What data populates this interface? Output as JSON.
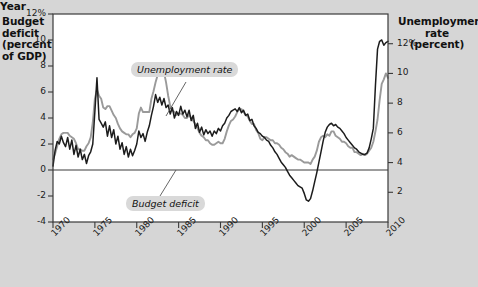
{
  "axes": {
    "left_title": "Budget deficit (percent of GDP)",
    "left_title_lines": [
      "Budget",
      "deficit",
      "(percent",
      "of GDP)"
    ],
    "right_title_lines": [
      "Unemployment",
      "rate",
      "(percent)"
    ],
    "x_title": "Year",
    "left_ticks": [
      "12%",
      "10",
      "8",
      "6",
      "4",
      "2",
      "0",
      "-2",
      "-4"
    ],
    "right_ticks": [
      "12%",
      "10",
      "8",
      "6",
      "4",
      "2"
    ],
    "x_ticks": [
      "1970",
      "1975",
      "1980",
      "1985",
      "1990",
      "1995",
      "2000",
      "2005",
      "2010"
    ]
  },
  "annotations": {
    "unemployment_label": "Unemployment rate",
    "deficit_label": "Budget deficit"
  },
  "colors": {
    "background": "#d6d6d6",
    "plot_background": "#ffffff",
    "unemployment_line": "#9a9a9a",
    "deficit_line": "#1c1c1c",
    "axis": "#3a3a3a",
    "callout_background": "#d9d9d9"
  },
  "chart_data": {
    "type": "line",
    "title": "",
    "xlabel": "Year",
    "ylabel": "Budget deficit (percent of GDP)",
    "ylabel_right": "Unemployment rate (percent)",
    "xlim": [
      1970,
      2010
    ],
    "ylim": [
      -4,
      12
    ],
    "ylim_right": [
      0,
      14
    ],
    "grid": false,
    "legend": "inline-callouts",
    "series": [
      {
        "name": "Budget deficit",
        "axis": "left",
        "color": "#1c1c1c",
        "x": [
          1970.0,
          1970.25,
          1970.5,
          1970.75,
          1971.0,
          1971.25,
          1971.5,
          1971.75,
          1972.0,
          1972.25,
          1972.5,
          1972.75,
          1973.0,
          1973.25,
          1973.5,
          1973.75,
          1974.0,
          1974.25,
          1974.5,
          1974.75,
          1975.0,
          1975.25,
          1975.5,
          1975.75,
          1976.0,
          1976.25,
          1976.5,
          1976.75,
          1977.0,
          1977.25,
          1977.5,
          1977.75,
          1978.0,
          1978.25,
          1978.5,
          1978.75,
          1979.0,
          1979.25,
          1979.5,
          1979.75,
          1980.0,
          1980.25,
          1980.5,
          1980.75,
          1981.0,
          1981.25,
          1981.5,
          1981.75,
          1982.0,
          1982.25,
          1982.5,
          1982.75,
          1983.0,
          1983.25,
          1983.5,
          1983.75,
          1984.0,
          1984.25,
          1984.5,
          1984.75,
          1985.0,
          1985.25,
          1985.5,
          1985.75,
          1986.0,
          1986.25,
          1986.5,
          1986.75,
          1987.0,
          1987.25,
          1987.5,
          1987.75,
          1988.0,
          1988.25,
          1988.5,
          1988.75,
          1989.0,
          1989.25,
          1989.5,
          1989.75,
          1990.0,
          1990.25,
          1990.5,
          1990.75,
          1991.0,
          1991.25,
          1991.5,
          1991.75,
          1992.0,
          1992.25,
          1992.5,
          1992.75,
          1993.0,
          1993.25,
          1993.5,
          1993.75,
          1994.0,
          1994.25,
          1994.5,
          1994.75,
          1995.0,
          1995.25,
          1995.5,
          1995.75,
          1996.0,
          1996.25,
          1996.5,
          1996.75,
          1997.0,
          1997.25,
          1997.5,
          1997.75,
          1998.0,
          1998.25,
          1998.5,
          1998.75,
          1999.0,
          1999.25,
          1999.5,
          1999.75,
          2000.0,
          2000.25,
          2000.5,
          2000.75,
          2001.0,
          2001.25,
          2001.5,
          2001.75,
          2002.0,
          2002.25,
          2002.5,
          2002.75,
          2003.0,
          2003.25,
          2003.5,
          2003.75,
          2004.0,
          2004.25,
          2004.5,
          2004.75,
          2005.0,
          2005.25,
          2005.5,
          2005.75,
          2006.0,
          2006.25,
          2006.5,
          2006.75,
          2007.0,
          2007.25,
          2007.5,
          2007.75,
          2008.0,
          2008.25,
          2008.5,
          2008.75,
          2009.0,
          2009.25,
          2009.5,
          2009.75,
          2010.0
        ],
        "y": [
          0.3,
          1.5,
          2.2,
          2.0,
          2.6,
          2.1,
          1.8,
          2.5,
          1.6,
          2.3,
          1.2,
          1.9,
          1.0,
          1.6,
          0.8,
          1.2,
          0.5,
          1.1,
          1.4,
          2.0,
          4.5,
          7.1,
          3.9,
          3.6,
          3.3,
          3.7,
          2.6,
          3.4,
          2.5,
          3.1,
          2.0,
          2.6,
          1.6,
          2.1,
          1.2,
          1.8,
          1.0,
          1.6,
          1.1,
          1.5,
          2.0,
          3.0,
          2.5,
          2.8,
          2.2,
          2.9,
          3.4,
          4.2,
          4.9,
          5.8,
          5.2,
          5.6,
          5.0,
          5.5,
          4.8,
          5.0,
          4.3,
          4.8,
          4.0,
          4.5,
          4.2,
          4.9,
          4.3,
          4.6,
          4.1,
          4.6,
          3.8,
          4.2,
          3.2,
          3.6,
          2.9,
          3.3,
          2.7,
          3.1,
          2.8,
          3.0,
          2.6,
          3.0,
          2.8,
          3.2,
          3.0,
          3.4,
          3.6,
          4.0,
          4.2,
          4.5,
          4.6,
          4.7,
          4.5,
          4.8,
          4.4,
          4.6,
          4.2,
          4.3,
          3.8,
          3.9,
          3.4,
          3.2,
          2.9,
          2.8,
          2.6,
          2.5,
          2.3,
          2.2,
          1.9,
          1.7,
          1.4,
          1.2,
          0.9,
          0.6,
          0.4,
          0.2,
          -0.1,
          -0.4,
          -0.6,
          -0.8,
          -1.0,
          -1.2,
          -1.3,
          -1.4,
          -1.8,
          -2.3,
          -2.4,
          -2.2,
          -1.6,
          -0.9,
          -0.2,
          0.6,
          1.4,
          2.2,
          2.9,
          3.3,
          3.5,
          3.6,
          3.4,
          3.5,
          3.3,
          3.2,
          3.0,
          2.8,
          2.5,
          2.3,
          2.1,
          1.9,
          1.7,
          1.6,
          1.4,
          1.3,
          1.2,
          1.2,
          1.3,
          1.7,
          2.4,
          3.2,
          6.5,
          9.3,
          9.9,
          10.0,
          9.6,
          9.8,
          9.9
        ]
      },
      {
        "name": "Unemployment rate",
        "axis": "right",
        "color": "#9a9a9a",
        "x": [
          1970.0,
          1970.25,
          1970.5,
          1970.75,
          1971.0,
          1971.25,
          1971.5,
          1971.75,
          1972.0,
          1972.25,
          1972.5,
          1972.75,
          1973.0,
          1973.25,
          1973.5,
          1973.75,
          1974.0,
          1974.25,
          1974.5,
          1974.75,
          1975.0,
          1975.25,
          1975.5,
          1975.75,
          1976.0,
          1976.25,
          1976.5,
          1976.75,
          1977.0,
          1977.25,
          1977.5,
          1977.75,
          1978.0,
          1978.25,
          1978.5,
          1978.75,
          1979.0,
          1979.25,
          1979.5,
          1979.75,
          1980.0,
          1980.25,
          1980.5,
          1980.75,
          1981.0,
          1981.25,
          1981.5,
          1981.75,
          1982.0,
          1982.25,
          1982.5,
          1982.75,
          1983.0,
          1983.25,
          1983.5,
          1983.75,
          1984.0,
          1984.25,
          1984.5,
          1984.75,
          1985.0,
          1985.25,
          1985.5,
          1985.75,
          1986.0,
          1986.25,
          1986.5,
          1986.75,
          1987.0,
          1987.25,
          1987.5,
          1987.75,
          1988.0,
          1988.25,
          1988.5,
          1988.75,
          1989.0,
          1989.25,
          1989.5,
          1989.75,
          1990.0,
          1990.25,
          1990.5,
          1990.75,
          1991.0,
          1991.25,
          1991.5,
          1991.75,
          1992.0,
          1992.25,
          1992.5,
          1992.75,
          1993.0,
          1993.25,
          1993.5,
          1993.75,
          1994.0,
          1994.25,
          1994.5,
          1994.75,
          1995.0,
          1995.25,
          1995.5,
          1995.75,
          1996.0,
          1996.25,
          1996.5,
          1996.75,
          1997.0,
          1997.25,
          1997.5,
          1997.75,
          1998.0,
          1998.25,
          1998.5,
          1998.75,
          1999.0,
          1999.25,
          1999.5,
          1999.75,
          2000.0,
          2000.25,
          2000.5,
          2000.75,
          2001.0,
          2001.25,
          2001.5,
          2001.75,
          2002.0,
          2002.25,
          2002.5,
          2002.75,
          2003.0,
          2003.25,
          2003.5,
          2003.75,
          2004.0,
          2004.25,
          2004.5,
          2004.75,
          2005.0,
          2005.25,
          2005.5,
          2005.75,
          2006.0,
          2006.25,
          2006.5,
          2006.75,
          2007.0,
          2007.25,
          2007.5,
          2007.75,
          2008.0,
          2008.25,
          2008.5,
          2008.75,
          2009.0,
          2009.25,
          2009.5,
          2009.75,
          2010.0
        ],
        "y": [
          4.2,
          4.6,
          5.1,
          5.6,
          5.9,
          6.0,
          6.0,
          6.0,
          5.8,
          5.7,
          5.6,
          5.3,
          4.9,
          4.9,
          4.8,
          4.8,
          5.1,
          5.3,
          5.7,
          6.7,
          8.3,
          8.9,
          8.5,
          8.3,
          7.7,
          7.6,
          7.8,
          7.8,
          7.5,
          7.2,
          7.0,
          6.6,
          6.3,
          6.1,
          6.0,
          5.9,
          5.9,
          5.7,
          5.9,
          6.0,
          6.3,
          7.3,
          7.7,
          7.4,
          7.4,
          7.4,
          7.4,
          8.3,
          8.8,
          9.4,
          9.9,
          10.7,
          10.4,
          10.1,
          9.4,
          8.5,
          7.8,
          7.5,
          7.4,
          7.2,
          7.3,
          7.3,
          7.2,
          7.0,
          7.0,
          7.2,
          7.0,
          6.8,
          6.6,
          6.3,
          6.0,
          5.8,
          5.7,
          5.5,
          5.5,
          5.3,
          5.2,
          5.2,
          5.3,
          5.4,
          5.3,
          5.3,
          5.6,
          6.1,
          6.5,
          6.8,
          6.9,
          7.1,
          7.4,
          7.6,
          7.6,
          7.4,
          7.2,
          7.1,
          6.8,
          6.6,
          6.6,
          6.2,
          6.0,
          5.6,
          5.5,
          5.7,
          5.7,
          5.6,
          5.5,
          5.5,
          5.3,
          5.3,
          5.2,
          5.0,
          4.9,
          4.7,
          4.6,
          4.4,
          4.5,
          4.4,
          4.3,
          4.2,
          4.2,
          4.1,
          4.0,
          4.0,
          4.0,
          3.9,
          4.2,
          4.4,
          4.8,
          5.4,
          5.7,
          5.8,
          5.7,
          5.9,
          5.8,
          6.1,
          6.1,
          5.8,
          5.7,
          5.6,
          5.4,
          5.4,
          5.3,
          5.1,
          5.0,
          5.0,
          4.7,
          4.7,
          4.6,
          4.5,
          4.6,
          4.5,
          4.6,
          4.8,
          5.0,
          5.4,
          6.1,
          6.9,
          8.2,
          9.3,
          9.6,
          10.0,
          9.7
        ]
      }
    ]
  }
}
